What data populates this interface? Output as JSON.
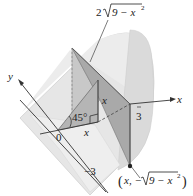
{
  "figure": {
    "type": "3D solid cross-section diagram",
    "labels": {
      "top_expression": "2√(9 − x²)",
      "top_coef": "2",
      "top_radicand": "9 − x",
      "top_exp": "2",
      "y_axis": "y",
      "x_axis": "x",
      "origin": "0",
      "x_tick": "3",
      "y_tick": "−3",
      "angle": "45°",
      "base_x": "x",
      "height_x": "x",
      "point_open": "(",
      "point_x": "x,",
      "point_neg": "−",
      "point_radicand": "9 − x",
      "point_exp": "2",
      "point_close": ")"
    },
    "colors": {
      "solid_fill": "#e3e3e3",
      "solid_edge": "#cfcfcf",
      "section_fill": "#a9a9a9",
      "section_dark": "#8f8f8f",
      "axis": "#333333",
      "text": "#222222"
    }
  }
}
